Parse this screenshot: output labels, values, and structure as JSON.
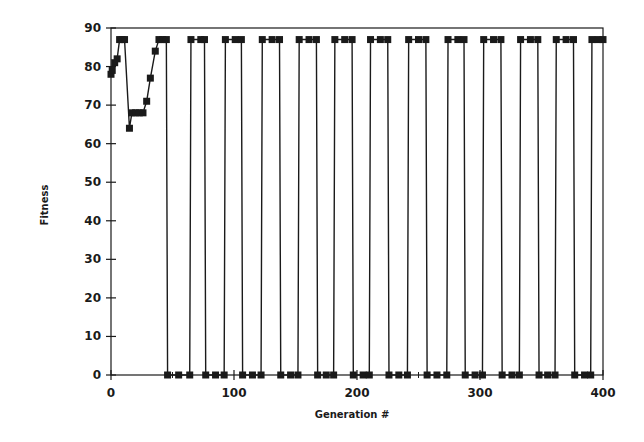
{
  "chart_data": {
    "type": "line",
    "title": "",
    "xlabel": "Generation #",
    "ylabel": "Fitness",
    "xlim": [
      0,
      400
    ],
    "ylim": [
      0,
      90
    ],
    "xticks": [
      0,
      100,
      200,
      300,
      400
    ],
    "yticks": [
      0,
      10,
      20,
      30,
      40,
      50,
      60,
      70,
      80,
      90
    ],
    "grid": false,
    "legend": null,
    "marker": "square",
    "series": [
      {
        "name": "Fitness",
        "points": [
          [
            0,
            78
          ],
          [
            1,
            79
          ],
          [
            3,
            81
          ],
          [
            5,
            82
          ],
          [
            7,
            87
          ],
          [
            9,
            87
          ],
          [
            11,
            87
          ],
          [
            15,
            64
          ],
          [
            17,
            68
          ],
          [
            20,
            68
          ],
          [
            23,
            68
          ],
          [
            26,
            68
          ],
          [
            29,
            71
          ],
          [
            32,
            77
          ],
          [
            36,
            84
          ],
          [
            39,
            87
          ],
          [
            42,
            87
          ],
          [
            45,
            87
          ],
          [
            46,
            0
          ],
          [
            55,
            0
          ],
          [
            64,
            0
          ],
          [
            65,
            87
          ],
          [
            73,
            87
          ],
          [
            76,
            87
          ],
          [
            77,
            0
          ],
          [
            85,
            0
          ],
          [
            92,
            0
          ],
          [
            93,
            87
          ],
          [
            101,
            87
          ],
          [
            106,
            87
          ],
          [
            107,
            0
          ],
          [
            115,
            0
          ],
          [
            122,
            0
          ],
          [
            123,
            87
          ],
          [
            131,
            87
          ],
          [
            137,
            87
          ],
          [
            138,
            0
          ],
          [
            146,
            0
          ],
          [
            152,
            0
          ],
          [
            153,
            87
          ],
          [
            161,
            87
          ],
          [
            167,
            87
          ],
          [
            168,
            0
          ],
          [
            175,
            0
          ],
          [
            181,
            0
          ],
          [
            182,
            87
          ],
          [
            190,
            87
          ],
          [
            196,
            87
          ],
          [
            197,
            0
          ],
          [
            205,
            0
          ],
          [
            210,
            0
          ],
          [
            211,
            87
          ],
          [
            219,
            87
          ],
          [
            225,
            87
          ],
          [
            226,
            0
          ],
          [
            234,
            0
          ],
          [
            241,
            0
          ],
          [
            242,
            87
          ],
          [
            250,
            87
          ],
          [
            256,
            87
          ],
          [
            257,
            0
          ],
          [
            265,
            0
          ],
          [
            273,
            0
          ],
          [
            274,
            87
          ],
          [
            282,
            87
          ],
          [
            287,
            87
          ],
          [
            288,
            0
          ],
          [
            296,
            0
          ],
          [
            302,
            0
          ],
          [
            303,
            87
          ],
          [
            311,
            87
          ],
          [
            317,
            87
          ],
          [
            318,
            0
          ],
          [
            326,
            0
          ],
          [
            332,
            0
          ],
          [
            333,
            87
          ],
          [
            341,
            87
          ],
          [
            347,
            87
          ],
          [
            348,
            0
          ],
          [
            355,
            0
          ],
          [
            361,
            0
          ],
          [
            362,
            87
          ],
          [
            370,
            87
          ],
          [
            376,
            87
          ],
          [
            377,
            0
          ],
          [
            385,
            0
          ],
          [
            390,
            0
          ],
          [
            391,
            87
          ],
          [
            396,
            87
          ],
          [
            400,
            87
          ]
        ]
      }
    ]
  }
}
